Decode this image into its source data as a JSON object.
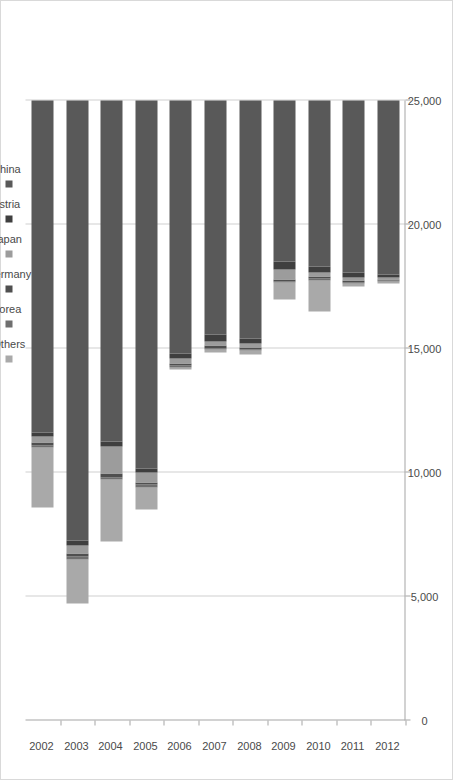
{
  "chart_data": {
    "type": "bar",
    "subtype": "stacked-horizontal-bar",
    "orientation": "rotated-90",
    "title": "",
    "subtitle": "",
    "xlabel": "",
    "ylabel": "",
    "xlim": [
      0,
      25000
    ],
    "grid": true,
    "legend_position": "top",
    "value_axis_ticks": [
      "0",
      "5,000",
      "10,000",
      "15,000",
      "20,000",
      "25,000"
    ],
    "value_axis_tick_values": [
      0,
      5000,
      10000,
      15000,
      20000,
      25000
    ],
    "categories": [
      "2002",
      "2003",
      "2004",
      "2005",
      "2006",
      "2007",
      "2008",
      "2009",
      "2010",
      "2011",
      "2012"
    ],
    "series": [
      {
        "name": "China",
        "color": "#595959",
        "values": [
          13400,
          17750,
          13750,
          14850,
          10200,
          9450,
          9600,
          6500,
          6700,
          6950,
          7000
        ]
      },
      {
        "name": "Austria",
        "color": "#3f3f3f",
        "values": [
          150,
          200,
          200,
          150,
          200,
          250,
          200,
          300,
          250,
          200,
          150
        ]
      },
      {
        "name": "Japan",
        "color": "#9c9c9c",
        "values": [
          250,
          300,
          1100,
          400,
          200,
          200,
          150,
          400,
          150,
          100,
          60
        ]
      },
      {
        "name": "Germany",
        "color": "#4f4f4f",
        "values": [
          100,
          150,
          150,
          100,
          100,
          100,
          80,
          90,
          90,
          80,
          60
        ]
      },
      {
        "name": "Korea",
        "color": "#6f6f6f",
        "values": [
          100,
          100,
          100,
          100,
          60,
          60,
          50,
          50,
          60,
          50,
          40
        ]
      },
      {
        "name": "All Others",
        "color": "#a9a9a9",
        "values": [
          2400,
          1800,
          2500,
          900,
          100,
          100,
          150,
          700,
          1250,
          120,
          80
        ]
      }
    ],
    "totals": [
      16400,
      20300,
      17800,
      16500,
      10860,
      10160,
      10230,
      8040,
      8500,
      7500,
      7390
    ]
  },
  "legend": {
    "items": [
      {
        "label": "All Others",
        "color": "#a9a9a9"
      },
      {
        "label": "Korea",
        "color": "#6f6f6f"
      },
      {
        "label": "Germany",
        "color": "#4f4f4f"
      },
      {
        "label": "Japan",
        "color": "#9c9c9c"
      },
      {
        "label": "Austria",
        "color": "#3f3f3f"
      },
      {
        "label": "China",
        "color": "#595959"
      }
    ]
  },
  "axes": {
    "value_ticks": [
      "0",
      "5,000",
      "10,000",
      "15,000",
      "20,000",
      "25,000"
    ],
    "category_ticks": [
      "2002",
      "2003",
      "2004",
      "2005",
      "2006",
      "2007",
      "2008",
      "2009",
      "2010",
      "2011",
      "2012"
    ]
  },
  "style": {
    "plot_background": "#ffffff",
    "gridline_color": "#d0d0d0",
    "axis_color": "#a6a6a6",
    "frame_color": "#d9d9d9",
    "text_color": "#4a4a4a"
  }
}
